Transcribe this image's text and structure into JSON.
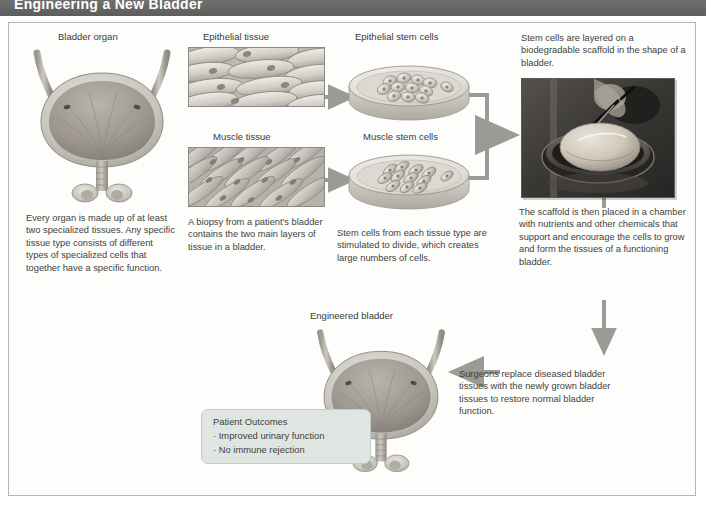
{
  "header": {
    "title": "Engineering a New Bladder"
  },
  "labels": {
    "bladder_organ": "Bladder organ",
    "epithelial_tissue": "Epithelial tissue",
    "muscle_tissue": "Muscle tissue",
    "epithelial_stem_cells": "Epithelial stem cells",
    "muscle_stem_cells": "Muscle stem cells",
    "engineered_bladder": "Engineered bladder"
  },
  "captions": {
    "organ": "Every organ is made up of at least two specialized tissues. Any specific tissue type consists of different types of specialized cells that together have a specific function.",
    "biopsy": "A biopsy from a patient's bladder contains the two main layers of tissue in a bladder.",
    "stem_cells": "Stem cells from each tissue type are stimulated to divide, which creates large numbers of cells.",
    "scaffold_top": "Stem cells are layered on a biodegradable scaffold in the shape of a bladder.",
    "chamber": "The scaffold is then placed in a chamber with nutrients and other chemicals that support and encourage the cells to grow and form the tissues of a functioning bladder.",
    "surgeons": "Surgeons replace diseased bladder tissues with the newly grown bladder tissues to restore normal bladder function."
  },
  "outcomes": {
    "title": "Patient Outcomes",
    "items": [
      "· Improved urinary function",
      "· No immune rejection"
    ]
  },
  "colors": {
    "header_bar": "#666666",
    "frame_border": "#b9b6ae",
    "arrow": "#9a9a96",
    "outcome_box": "#dfe6e2",
    "text": "#3f3f3d"
  },
  "icons": {
    "bladder": "bladder-organ-icon",
    "tissue": "tissue-micrograph-icon",
    "dish": "petri-dish-icon",
    "photo": "scaffold-photograph-icon",
    "arrow": "flow-arrow-icon"
  }
}
